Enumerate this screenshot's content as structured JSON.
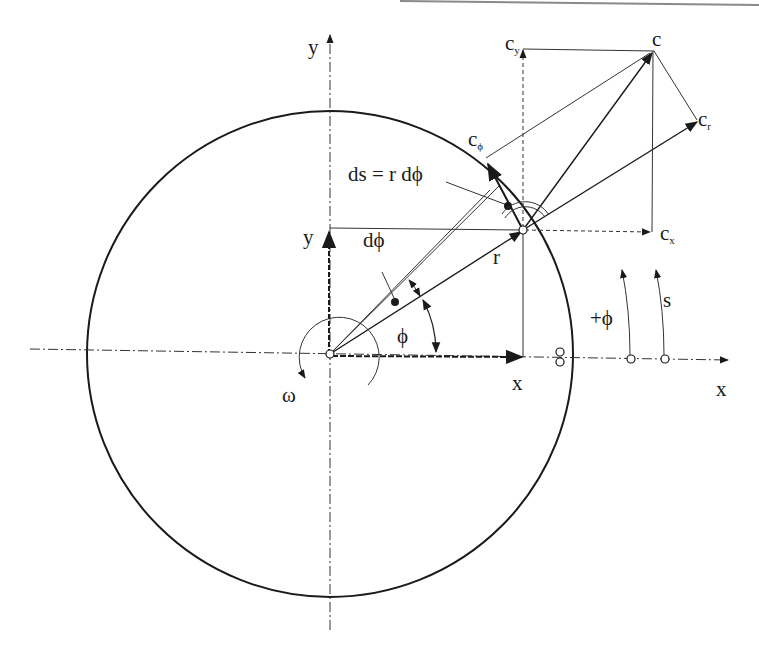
{
  "diagram": {
    "labels": {
      "y_axis_top": "y",
      "x_axis_right": "x",
      "y_component": "y",
      "x_component": "x",
      "radius": "r",
      "angle": "ϕ",
      "dphi": "dϕ",
      "arc_length": "ds = r dϕ",
      "omega": "ω",
      "plus_phi": "+ϕ",
      "s": "s",
      "c": "c",
      "c_base": "c",
      "cy_sub": "y",
      "cx_sub": "x",
      "cr_sub": "r",
      "cphi_sub": "ϕ"
    },
    "colors": {
      "line": "#1a1a1a",
      "background": "#ffffff",
      "top_rule": "#8a8a8a"
    }
  }
}
